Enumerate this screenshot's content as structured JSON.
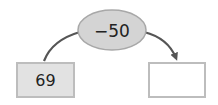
{
  "diagram": {
    "operation": {
      "label": "−50",
      "fill": "#d4d4d4",
      "stroke": "#a8a8a8"
    },
    "input_box": {
      "value": "69",
      "fill": "#e2e2e2",
      "stroke": "#bdbdbd"
    },
    "output_box": {
      "value": "",
      "fill": "#ffffff",
      "stroke": "#bdbdbd"
    },
    "arrow_color": "#555555"
  }
}
